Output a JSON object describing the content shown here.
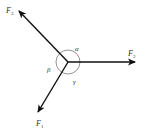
{
  "diagram": {
    "title": "",
    "center": {
      "x": 68,
      "y": 62
    },
    "circle_radius": 12,
    "colors": {
      "vector": "#111111",
      "circle": "#777777",
      "label": "#333333"
    },
    "vectors": [
      {
        "name": "F1",
        "label": "F",
        "subscript": "1",
        "tip": {
          "x": 37,
          "y": 113
        },
        "label_pos": {
          "x": 36,
          "y": 126
        }
      },
      {
        "name": "F2",
        "label": "F",
        "subscript": "2",
        "tip": {
          "x": 136,
          "y": 62
        },
        "label_pos": {
          "x": 128,
          "y": 56
        }
      },
      {
        "name": "F3",
        "label": "F",
        "subscript": "3",
        "tip": {
          "x": 18,
          "y": 10
        },
        "label_pos": {
          "x": 6,
          "y": 13
        }
      }
    ],
    "angles": [
      {
        "name": "alpha",
        "symbol": "α",
        "pos": {
          "x": 75,
          "y": 51
        }
      },
      {
        "name": "beta",
        "symbol": "β",
        "pos": {
          "x": 47,
          "y": 72
        }
      },
      {
        "name": "gamma",
        "symbol": "γ",
        "pos": {
          "x": 73,
          "y": 84
        }
      }
    ]
  }
}
